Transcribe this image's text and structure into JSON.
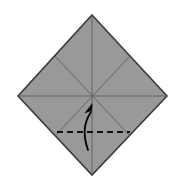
{
  "figure": {
    "type": "origami-step-diagram",
    "canvas": {
      "width": 181,
      "height": 184,
      "background": "#ffffff"
    }
  },
  "shape": {
    "name": "square-rotated-45-diamond",
    "fill_color": "#999999",
    "stroke_color": "#3a3a3a",
    "stroke_width": 1.6,
    "vertices": {
      "top": {
        "x": 92,
        "y": 15
      },
      "right": {
        "x": 167,
        "y": 96
      },
      "bottom": {
        "x": 92,
        "y": 175
      },
      "left": {
        "x": 18,
        "y": 96
      }
    },
    "center": {
      "x": 92,
      "y": 96
    }
  },
  "creases": {
    "color": "#5e5e5e",
    "width": 0.9,
    "count": 4,
    "lines": [
      {
        "name": "vertical-crease",
        "x1": 92,
        "y1": 15,
        "x2": 92,
        "y2": 175
      },
      {
        "name": "horizontal-crease",
        "x1": 18,
        "y1": 96,
        "x2": 167,
        "y2": 96
      },
      {
        "name": "diagonal-crease-nwse",
        "x1": 55,
        "y1": 56,
        "x2": 130,
        "y2": 136
      },
      {
        "name": "diagonal-crease-nesw",
        "x1": 130,
        "y1": 56,
        "x2": 55,
        "y2": 136
      }
    ]
  },
  "fold_line": {
    "name": "valley-fold-dashed-line",
    "style": "dashed",
    "color": "#111111",
    "width": 2.0,
    "dash_pattern": "6 4",
    "x1": 57,
    "y1": 132,
    "x2": 130,
    "y2": 132
  },
  "arrow": {
    "name": "fold-direction-arrow",
    "color": "#000000",
    "width": 1.8,
    "direction": "upward-curved",
    "tail": {
      "x": 88,
      "y": 150
    },
    "control": {
      "x": 80,
      "y": 128
    },
    "head": {
      "x": 91,
      "y": 112
    },
    "head_size": 9
  },
  "labels": {
    "caption": "",
    "step_number": ""
  }
}
